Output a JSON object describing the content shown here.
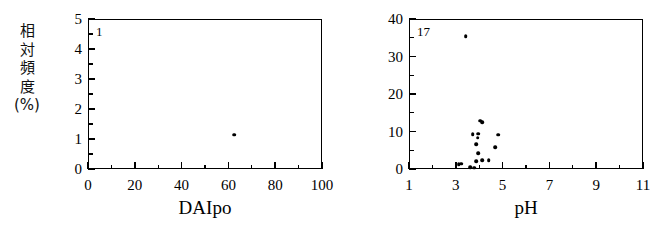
{
  "figure": {
    "background_color": "#ffffff",
    "foreground_color": "#000000",
    "panel_count": 2
  },
  "panels": [
    {
      "id": "daipo",
      "annotation": "1",
      "ylabel_chars": [
        "相",
        "対",
        "頻",
        "度",
        "(%)"
      ],
      "xlabel": "DAIpo",
      "x_ticks": [
        "0",
        "20",
        "40",
        "60",
        "80",
        "100"
      ],
      "y_ticks": [
        "0",
        "1",
        "2",
        "3",
        "4",
        "5"
      ]
    },
    {
      "id": "ph",
      "annotation": "17",
      "xlabel": "pH",
      "x_ticks": [
        "1",
        "3",
        "5",
        "7",
        "9",
        "11"
      ],
      "y_ticks": [
        "0",
        "10",
        "20",
        "30",
        "40"
      ]
    }
  ],
  "chart_data": [
    {
      "type": "scatter",
      "id": "daipo-scatter",
      "title": "",
      "xlabel": "DAIpo",
      "ylabel": "相対頻度(%)",
      "annotation": "1",
      "annotation_meaning": "number of data points",
      "xlim": [
        0,
        100
      ],
      "ylim": [
        0,
        5
      ],
      "x_ticks": [
        0,
        20,
        40,
        60,
        80,
        100
      ],
      "y_ticks": [
        0,
        1,
        2,
        3,
        4,
        5
      ],
      "x_minor_tick_step": 10,
      "y_minor_tick_step": 0.5,
      "grid": false,
      "legend": false,
      "marker": "filled-circle",
      "points": [
        {
          "x": 62.5,
          "y": 1.15
        }
      ]
    },
    {
      "type": "scatter",
      "id": "ph-scatter",
      "title": "",
      "xlabel": "pH",
      "ylabel": "相対頻度(%)",
      "annotation": "17",
      "annotation_meaning": "number of data points",
      "xlim": [
        1,
        11
      ],
      "ylim": [
        0,
        40
      ],
      "x_ticks": [
        1,
        3,
        5,
        7,
        9,
        11
      ],
      "y_ticks": [
        0,
        10,
        20,
        30,
        40
      ],
      "x_minor_tick_step": 1,
      "y_minor_tick_step": 5,
      "grid": false,
      "legend": false,
      "marker": "filled-circle",
      "points": [
        {
          "x": 3.42,
          "y": 35.4
        },
        {
          "x": 4.05,
          "y": 12.9
        },
        {
          "x": 4.12,
          "y": 12.5
        },
        {
          "x": 3.72,
          "y": 9.3
        },
        {
          "x": 3.95,
          "y": 9.4
        },
        {
          "x": 4.82,
          "y": 9.2
        },
        {
          "x": 3.93,
          "y": 8.3
        },
        {
          "x": 3.88,
          "y": 6.6
        },
        {
          "x": 4.68,
          "y": 5.8
        },
        {
          "x": 3.95,
          "y": 4.2
        },
        {
          "x": 4.12,
          "y": 2.3
        },
        {
          "x": 4.4,
          "y": 2.3
        },
        {
          "x": 3.88,
          "y": 2.1
        },
        {
          "x": 3.12,
          "y": 1.3
        },
        {
          "x": 3.22,
          "y": 1.4
        },
        {
          "x": 3.62,
          "y": 0.5
        },
        {
          "x": 3.78,
          "y": 0.3
        }
      ]
    }
  ]
}
